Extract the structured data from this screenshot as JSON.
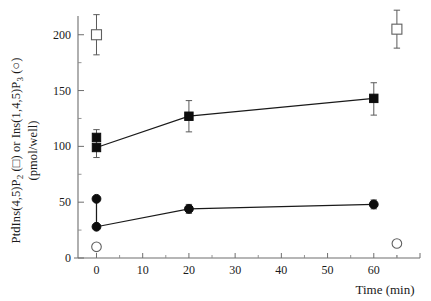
{
  "chart_data": {
    "type": "scatter",
    "title": "",
    "xlabel": "Time (min)",
    "ylabel_line1": "PtdIns(4,5)P",
    "ylabel_line1_sub": "2",
    "ylabel_line1_mid": " (□) or Ins(1,4,5)P",
    "ylabel_line1_sub2": "3",
    "ylabel_line1_end": " (○)",
    "ylabel_line2": "(pmol/well)",
    "xlim": [
      -4,
      70
    ],
    "ylim": [
      0,
      215
    ],
    "xticks": [
      0,
      10,
      20,
      30,
      40,
      50,
      60
    ],
    "xticklabels": [
      "0",
      "10",
      "20",
      "30",
      "40",
      "50",
      "60"
    ],
    "yticks": [
      0,
      50,
      100,
      150,
      200
    ],
    "yticklabels": [
      "0",
      "50",
      "100",
      "150",
      "200"
    ],
    "y_minor_ticks": [
      25,
      75,
      125,
      175
    ],
    "grid": false,
    "legend": "inline-in-axis-label",
    "series": [
      {
        "name": "PtdIns(4,5)P2 stimulated",
        "marker": "filled-square",
        "connected": true,
        "points": [
          {
            "x": 0,
            "y": 108,
            "yerr_low": 8,
            "yerr_high": 7
          },
          {
            "x": 0,
            "y": 99,
            "yerr_low": 9,
            "yerr_high": 0
          },
          {
            "x": 20,
            "y": 127,
            "yerr_low": 14,
            "yerr_high": 14
          },
          {
            "x": 60,
            "y": 143,
            "yerr_low": 15,
            "yerr_high": 14
          }
        ],
        "line_from": {
          "x": 0,
          "y": 99
        }
      },
      {
        "name": "PtdIns(4,5)P2 control",
        "marker": "open-square",
        "connected": false,
        "points": [
          {
            "x": 0,
            "y": 200,
            "yerr_low": 18,
            "yerr_high": 18
          },
          {
            "x": 65,
            "y": 205,
            "yerr_low": 17,
            "yerr_high": 17
          }
        ]
      },
      {
        "name": "Ins(1,4,5)P3 stimulated",
        "marker": "filled-circle",
        "connected": true,
        "points": [
          {
            "x": 0,
            "y": 53,
            "yerr_low": 0,
            "yerr_high": 0
          },
          {
            "x": 0,
            "y": 28,
            "yerr_low": 0,
            "yerr_high": 0
          },
          {
            "x": 20,
            "y": 44,
            "yerr_low": 4,
            "yerr_high": 4
          },
          {
            "x": 60,
            "y": 48,
            "yerr_low": 4,
            "yerr_high": 4
          }
        ],
        "line_from": {
          "x": 0,
          "y": 28
        }
      },
      {
        "name": "Ins(1,4,5)P3 control",
        "marker": "open-circle",
        "connected": false,
        "points": [
          {
            "x": 0,
            "y": 10,
            "yerr_low": 0,
            "yerr_high": 0
          },
          {
            "x": 65,
            "y": 13,
            "yerr_low": 0,
            "yerr_high": 0
          }
        ]
      }
    ],
    "colors": {
      "marker_fill": "#0d0d0d",
      "marker_open": "#ffffff",
      "marker_stroke": "#5f5f5f",
      "axis": "#6e6e6e",
      "connector": "#1a1a1a",
      "errorbar": "#5a5a5a",
      "background": "#ffffff"
    }
  }
}
